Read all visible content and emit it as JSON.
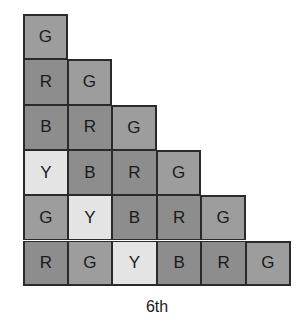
{
  "diagram": {
    "caption": "6th",
    "legend": {
      "R": "dark gray",
      "B": "dark gray",
      "G": "medium gray",
      "Y": "light gray"
    },
    "colors": {
      "R": "#8d8d8d",
      "B": "#8d8d8d",
      "G": "#9d9d9d",
      "Y": "#e4e4e4",
      "border": "#2a2a2a"
    },
    "rows": [
      [
        "G"
      ],
      [
        "R",
        "G"
      ],
      [
        "B",
        "R",
        "G"
      ],
      [
        "Y",
        "B",
        "R",
        "G"
      ],
      [
        "G",
        "Y",
        "B",
        "R",
        "G"
      ],
      [
        "R",
        "G",
        "Y",
        "B",
        "R",
        "G"
      ]
    ]
  }
}
